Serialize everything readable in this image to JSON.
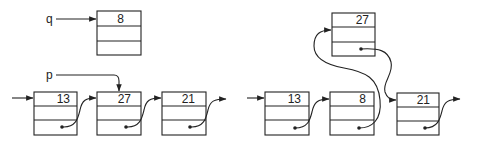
{
  "diagram": {
    "type": "linked-list-insertion",
    "before": {
      "variables": [
        {
          "name": "q",
          "points_to": "node_q"
        },
        {
          "name": "p",
          "points_to": "node_27"
        }
      ],
      "standalone_node": {
        "id": "node_q",
        "value": "8"
      },
      "list": [
        {
          "id": "node_13",
          "value": "13"
        },
        {
          "id": "node_27",
          "value": "27"
        },
        {
          "id": "node_21",
          "value": "21"
        }
      ]
    },
    "after": {
      "lifted_node": {
        "id": "node_27b",
        "value": "27"
      },
      "list": [
        {
          "id": "node_13b",
          "value": "13"
        },
        {
          "id": "node_8b",
          "value": "8"
        },
        {
          "id": "node_21b",
          "value": "21"
        }
      ]
    }
  }
}
